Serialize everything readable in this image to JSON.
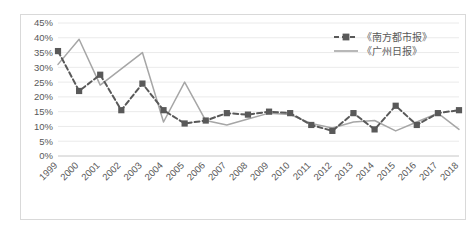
{
  "chart_data": {
    "type": "line",
    "title": "",
    "xlabel": "",
    "ylabel": "",
    "ylim": [
      0,
      45
    ],
    "ytick_labels": [
      "0%",
      "5%",
      "10%",
      "15%",
      "20%",
      "25%",
      "30%",
      "35%",
      "40%",
      "45%"
    ],
    "ytick_values": [
      0,
      5,
      10,
      15,
      20,
      25,
      30,
      35,
      40,
      45
    ],
    "grid": true,
    "legend_position": "top-right",
    "categories": [
      "1999",
      "2000",
      "2001",
      "2002",
      "2003",
      "2004",
      "2005",
      "2006",
      "2007",
      "2008",
      "2009",
      "2010",
      "2011",
      "2012",
      "2013",
      "2014",
      "2015",
      "2016",
      "2017",
      "2018"
    ],
    "series": [
      {
        "name": "《南方都市报》",
        "style": "dashed",
        "marker": "square",
        "color": "#595959",
        "values": [
          35.5,
          22.0,
          27.5,
          15.5,
          24.5,
          15.5,
          11.0,
          12.0,
          14.5,
          14.0,
          15.0,
          14.5,
          10.5,
          8.5,
          14.5,
          9.0,
          17.0,
          10.5,
          14.5,
          15.5
        ]
      },
      {
        "name": "《广州日报》",
        "style": "solid",
        "marker": "none",
        "color": "#a6a6a6",
        "values": [
          31.0,
          39.5,
          24.0,
          29.5,
          35.0,
          11.5,
          25.0,
          12.0,
          10.5,
          12.5,
          14.5,
          14.0,
          11.0,
          9.5,
          11.5,
          12.0,
          8.5,
          11.5,
          14.5,
          9.0
        ]
      }
    ]
  },
  "legend": {
    "items": [
      {
        "label": "《南方都市报》",
        "swatch": "dashed-square-marker"
      },
      {
        "label": "《广州日报》",
        "swatch": "solid-line"
      }
    ]
  },
  "colors": {
    "series_1": "#595959",
    "series_2": "#a6a6a6",
    "gridline": "#e4e4e4",
    "axis": "#bfbfbf",
    "text": "#595959",
    "plot_border": "#d9d9d9"
  }
}
